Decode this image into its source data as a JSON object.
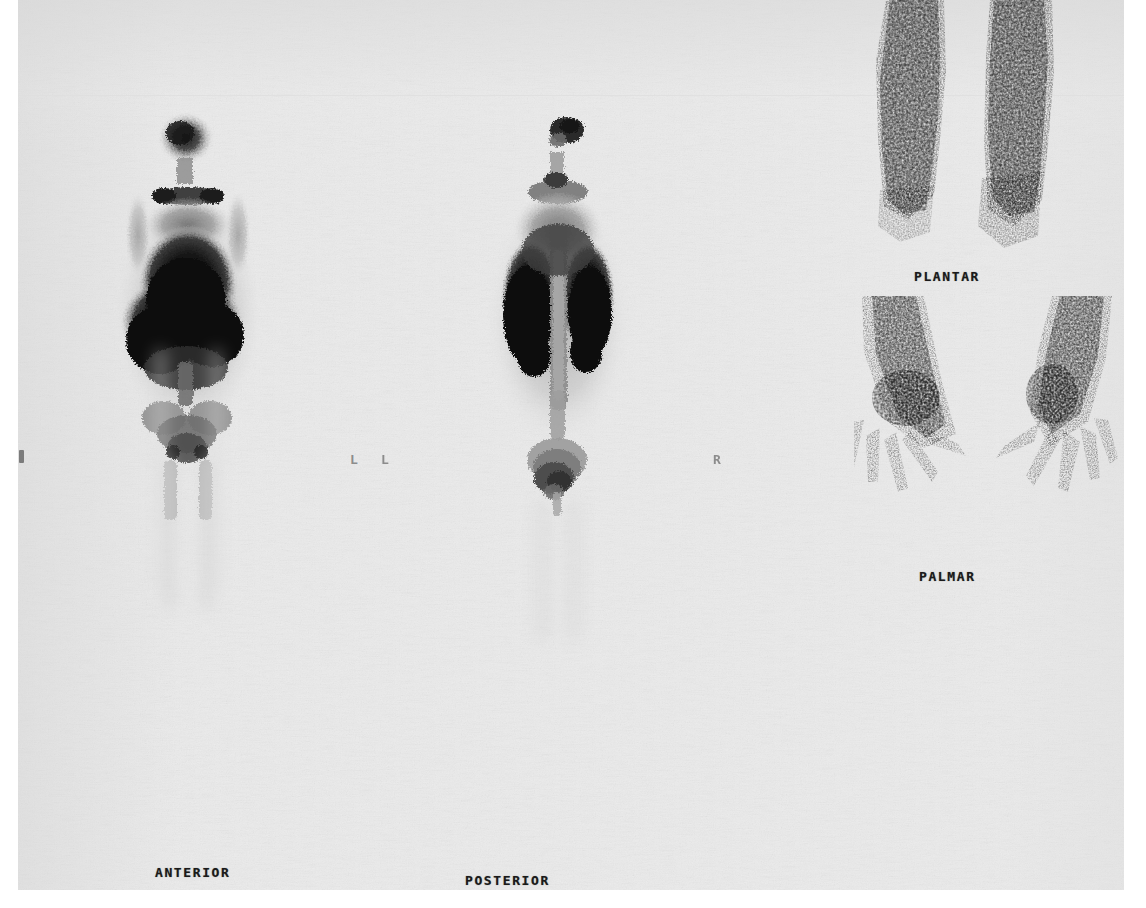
{
  "study": {
    "modality": "nuclear-medicine-bone-scintigraphy",
    "media": "film-sheet"
  },
  "labels": {
    "anterior": "ANTERIOR",
    "posterior": "POSTERIOR",
    "plantar": "PLANTAR",
    "palmar": "PALMAR"
  },
  "markers": {
    "left_a": "L",
    "left_b": "L",
    "right": "R"
  },
  "colors": {
    "film_base": "#ebebeb",
    "paper": "#ffffff",
    "label_ink": "#1a1a1a",
    "marker_ink": "#8c8c8c",
    "uptake_max": "#101010",
    "uptake_mid": "#5a5a5a",
    "uptake_low": "#b4b4b4"
  },
  "panels": [
    {
      "name": "anterior-whole-body",
      "label": "ANTERIOR",
      "view": "anterior",
      "regions": [
        {
          "name": "skull",
          "intensity": "high"
        },
        {
          "name": "cervical-spine",
          "intensity": "medium"
        },
        {
          "name": "shoulders-clavicles",
          "intensity": "medium"
        },
        {
          "name": "sternum-ribs",
          "intensity": "high"
        },
        {
          "name": "liver-chest",
          "intensity": "very-high"
        },
        {
          "name": "pelvis",
          "intensity": "medium"
        },
        {
          "name": "femora-legs",
          "intensity": "low"
        }
      ]
    },
    {
      "name": "posterior-whole-body",
      "label": "POSTERIOR",
      "view": "posterior",
      "regions": [
        {
          "name": "skull",
          "intensity": "high"
        },
        {
          "name": "spine",
          "intensity": "medium"
        },
        {
          "name": "lungs-bilateral",
          "intensity": "very-high"
        },
        {
          "name": "kidneys",
          "intensity": "high"
        },
        {
          "name": "bladder",
          "intensity": "medium"
        },
        {
          "name": "legs",
          "intensity": "low"
        }
      ]
    },
    {
      "name": "plantar-feet",
      "label": "PLANTAR",
      "view": "plantar",
      "regions": [
        {
          "name": "left-foot",
          "intensity": "high"
        },
        {
          "name": "right-foot",
          "intensity": "high"
        }
      ]
    },
    {
      "name": "palmar-hands",
      "label": "PALMAR",
      "view": "palmar",
      "regions": [
        {
          "name": "left-forearm-hand",
          "intensity": "high"
        },
        {
          "name": "right-forearm-hand",
          "intensity": "high"
        },
        {
          "name": "fingers",
          "intensity": "medium"
        }
      ]
    }
  ]
}
